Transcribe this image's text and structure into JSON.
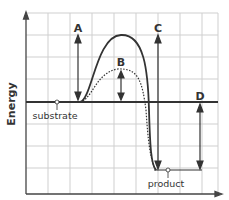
{
  "diagram": {
    "y_axis_label": "Energy",
    "labels": {
      "A": "A",
      "B": "B",
      "C": "C",
      "D": "D",
      "substrate": "substrate",
      "product": "product"
    },
    "series": [
      {
        "name": "uncatalyzed",
        "style": "solid"
      },
      {
        "name": "catalyzed",
        "style": "dotted"
      }
    ],
    "colors": {
      "grid": "#cccccc",
      "line": "#333333",
      "baseline": "#333333"
    }
  }
}
